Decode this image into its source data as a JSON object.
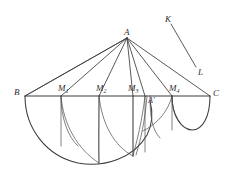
{
  "figure": {
    "type": "geometry-diagram",
    "background_color": "#ffffff",
    "stroke_color": "#3c3c40",
    "canvas": {
      "width": 232,
      "height": 181
    },
    "labels": [
      {
        "id": "A",
        "text": "A",
        "sub": "",
        "prime": false,
        "x": 124,
        "y": 28
      },
      {
        "id": "K",
        "text": "K",
        "sub": "",
        "prime": false,
        "x": 165,
        "y": 15
      },
      {
        "id": "L",
        "text": "L",
        "sub": "",
        "prime": false,
        "x": 198,
        "y": 68
      },
      {
        "id": "B",
        "text": "B",
        "sub": "",
        "prime": false,
        "x": 14,
        "y": 88
      },
      {
        "id": "C",
        "text": "C",
        "sub": "",
        "prime": false,
        "x": 213,
        "y": 89
      },
      {
        "id": "M1",
        "text": "M",
        "sub": "1",
        "prime": false,
        "x": 58,
        "y": 84
      },
      {
        "id": "M2",
        "text": "M",
        "sub": "2",
        "prime": false,
        "x": 96,
        "y": 84
      },
      {
        "id": "M3",
        "text": "M",
        "sub": "3",
        "prime": false,
        "x": 128,
        "y": 84
      },
      {
        "id": "M4",
        "text": "M",
        "sub": "4",
        "prime": false,
        "x": 169,
        "y": 84
      },
      {
        "id": "Ap",
        "text": "A",
        "sub": "",
        "prime": true,
        "x": 148,
        "y": 97
      }
    ],
    "points": {
      "A": {
        "x": 127,
        "y": 38
      },
      "B": {
        "x": 25,
        "y": 96
      },
      "C": {
        "x": 210,
        "y": 96
      },
      "M1": {
        "x": 61,
        "y": 96
      },
      "M2": {
        "x": 99,
        "y": 96
      },
      "M3": {
        "x": 133,
        "y": 96
      },
      "M4": {
        "x": 172,
        "y": 96
      },
      "Aprime": {
        "x": 147,
        "y": 96
      },
      "K": {
        "x": 171,
        "y": 24
      },
      "L": {
        "x": 196,
        "y": 67
      }
    },
    "segments": [
      {
        "name": "baseline-BC",
        "from": "B",
        "to": "C"
      },
      {
        "name": "ray-A-B",
        "from": "A",
        "to": "B"
      },
      {
        "name": "ray-A-C",
        "from": "A",
        "to": "C"
      },
      {
        "name": "ray-A-M1",
        "from": "A",
        "to": "M1"
      },
      {
        "name": "ray-A-M2",
        "from": "A",
        "to": "M2"
      },
      {
        "name": "ray-A-M3",
        "from": "A",
        "to": "M3"
      },
      {
        "name": "ray-A-M4",
        "from": "A",
        "to": "M4"
      },
      {
        "name": "ray-A-Aprime",
        "from": "A",
        "to": "Aprime"
      },
      {
        "name": "segment-K-L",
        "from": "K",
        "to": "L"
      }
    ],
    "arcs": [
      {
        "name": "semicircle-BC-outer",
        "chord": "B-C-lower-left"
      },
      {
        "name": "semicircle-M4-C",
        "chord": "M4-C"
      },
      {
        "name": "arc-from-B",
        "chord": "B-down"
      },
      {
        "name": "arc-from-M1"
      },
      {
        "name": "arc-from-M2"
      },
      {
        "name": "arc-from-M3"
      },
      {
        "name": "arc-from-M4"
      }
    ],
    "verticals": [
      {
        "name": "drop-M1"
      },
      {
        "name": "drop-M2"
      },
      {
        "name": "drop-M3"
      },
      {
        "name": "drop-M4"
      },
      {
        "name": "drop-Aprime"
      }
    ]
  }
}
